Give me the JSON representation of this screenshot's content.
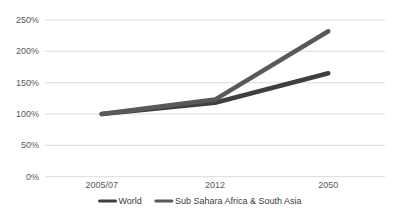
{
  "chart_data": {
    "type": "line",
    "title": "",
    "xlabel": "",
    "ylabel": "",
    "categories": [
      "2005/07",
      "2012",
      "2050"
    ],
    "series": [
      {
        "name": "World",
        "values": [
          100,
          118,
          165
        ],
        "color": "#3f3f3f"
      },
      {
        "name": "Sub Sahara Africa & South Asia",
        "values": [
          100,
          123,
          232
        ],
        "color": "#595959"
      }
    ],
    "ylim": [
      0,
      250
    ],
    "ytick_step": 50,
    "ytick_labels": [
      "0%",
      "50%",
      "100%",
      "150%",
      "200%",
      "250%"
    ],
    "ytick_format": "percent",
    "grid": "horizontal",
    "gridline_color": "#dcdcdc",
    "axis_label_color": "#595959",
    "legend_position": "bottom",
    "legend_text_color": "#404040",
    "background": "#ffffff",
    "line_width": 4.5
  }
}
